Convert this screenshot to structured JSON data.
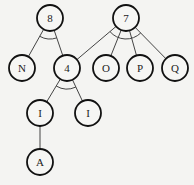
{
  "diagram": {
    "type": "and-or-tree",
    "nodes": [
      {
        "id": "n8",
        "label": "8",
        "x": 50,
        "y": 18
      },
      {
        "id": "n7",
        "label": "7",
        "x": 126,
        "y": 18
      },
      {
        "id": "nN",
        "label": "N",
        "x": 22,
        "y": 68
      },
      {
        "id": "n4",
        "label": "4",
        "x": 67,
        "y": 68
      },
      {
        "id": "nO",
        "label": "O",
        "x": 106,
        "y": 68
      },
      {
        "id": "nP",
        "label": "P",
        "x": 140,
        "y": 68
      },
      {
        "id": "nQ",
        "label": "Q",
        "x": 175,
        "y": 68
      },
      {
        "id": "nI1",
        "label": "I",
        "x": 40,
        "y": 113
      },
      {
        "id": "nI2",
        "label": "I",
        "x": 88,
        "y": 113
      },
      {
        "id": "nA",
        "label": "A",
        "x": 40,
        "y": 162
      }
    ],
    "edges": [
      {
        "from": "n8",
        "to": "nN"
      },
      {
        "from": "n8",
        "to": "n4"
      },
      {
        "from": "n7",
        "to": "n4"
      },
      {
        "from": "n7",
        "to": "nO"
      },
      {
        "from": "n7",
        "to": "nP"
      },
      {
        "from": "n7",
        "to": "nQ"
      },
      {
        "from": "n4",
        "to": "nI1"
      },
      {
        "from": "n4",
        "to": "nI2"
      },
      {
        "from": "nI1",
        "to": "nA"
      }
    ],
    "and_arcs": [
      "n8",
      "n7",
      "n4"
    ]
  }
}
